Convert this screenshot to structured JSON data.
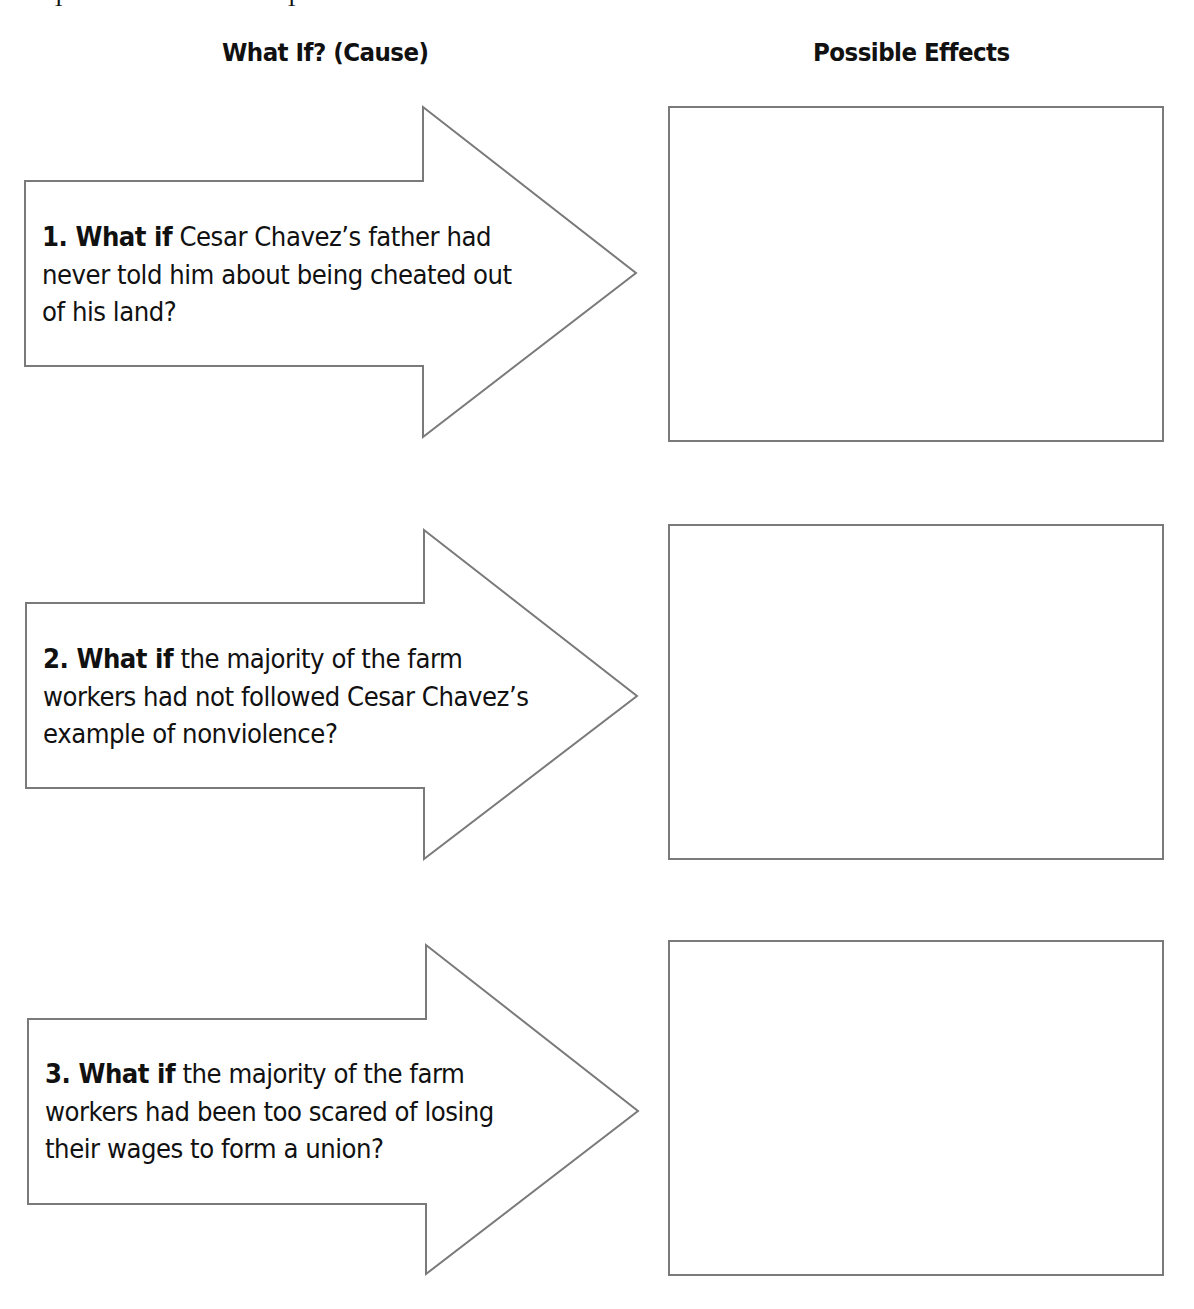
{
  "headers": {
    "cause": "What If? (Cause)",
    "effects": "Possible Effects"
  },
  "rows": [
    {
      "number_label": "1. What if",
      "question": " Cesar Chavez’s father had never told him about being cheated out of his land?",
      "effect_answer": ""
    },
    {
      "number_label": "2. What if",
      "question": " the majority of the farm workers had not followed Cesar Chavez’s example of nonviolence?",
      "effect_answer": ""
    },
    {
      "number_label": "3. What if",
      "question": " the majority of the farm workers had been too scared of losing their wages to form a union?",
      "effect_answer": ""
    }
  ],
  "colors": {
    "stroke": "#7a7a7a",
    "text": "#111111",
    "background": "#ffffff"
  }
}
